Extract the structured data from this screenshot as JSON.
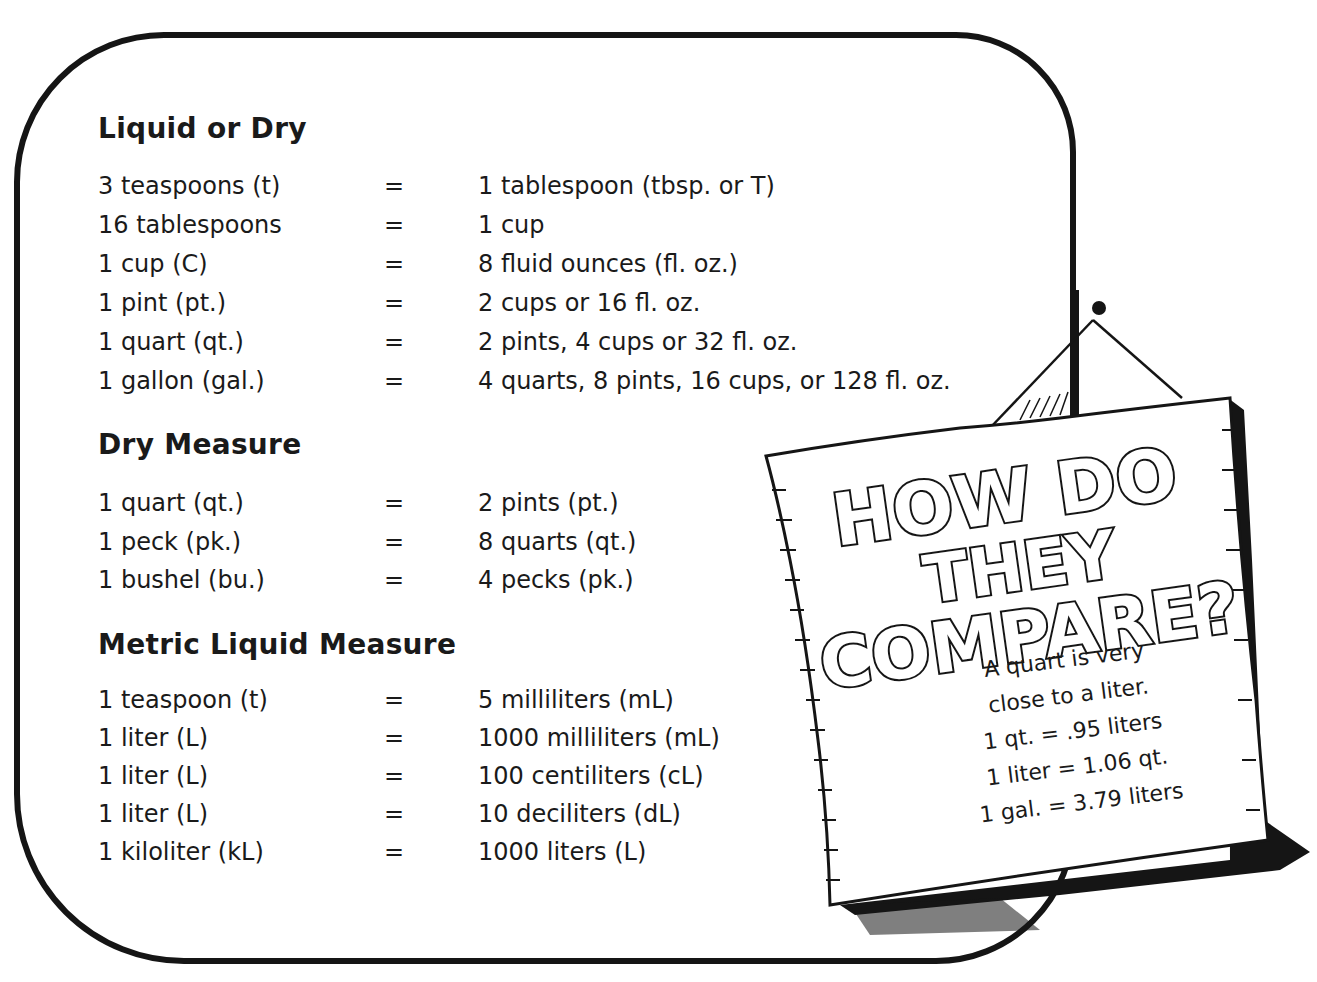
{
  "sections": [
    {
      "title": "Liquid or Dry",
      "rows": [
        {
          "lhs": "3 teaspoons (t)",
          "eq": "=",
          "rhs": "1 tablespoon (tbsp. or T)"
        },
        {
          "lhs": "16 tablespoons",
          "eq": "=",
          "rhs": "1 cup"
        },
        {
          "lhs": "1 cup (C)",
          "eq": "=",
          "rhs": "8 fluid ounces (fl. oz.)"
        },
        {
          "lhs": "1 pint (pt.)",
          "eq": "=",
          "rhs": "2 cups or 16 fl. oz."
        },
        {
          "lhs": "1 quart (qt.)",
          "eq": "=",
          "rhs": "2 pints, 4 cups or 32 fl. oz."
        },
        {
          "lhs": "1 gallon (gal.)",
          "eq": "=",
          "rhs": "4 quarts, 8 pints, 16 cups, or 128 fl. oz."
        }
      ]
    },
    {
      "title": "Dry Measure",
      "rows": [
        {
          "lhs": "1 quart (qt.)",
          "eq": "=",
          "rhs": "2 pints (pt.)"
        },
        {
          "lhs": "1 peck (pk.)",
          "eq": "=",
          "rhs": "8 quarts (qt.)"
        },
        {
          "lhs": "1 bushel (bu.)",
          "eq": "=",
          "rhs": "4 pecks (pk.)"
        }
      ]
    },
    {
      "title": "Metric Liquid Measure",
      "rows": [
        {
          "lhs": "1 teaspoon (t)",
          "eq": "=",
          "rhs": "5 milliliters (mL)"
        },
        {
          "lhs": "1 liter (L)",
          "eq": "=",
          "rhs": "1000 milliliters (mL)"
        },
        {
          "lhs": "1 liter (L)",
          "eq": "=",
          "rhs": "100 centiliters (cL)"
        },
        {
          "lhs": "1 liter (L)",
          "eq": "=",
          "rhs": "10 deciliters (dL)"
        },
        {
          "lhs": "1 kiloliter (kL)",
          "eq": "=",
          "rhs": "1000 liters (L)"
        }
      ]
    }
  ],
  "sign": {
    "headline": [
      "HOW DO",
      "THEY",
      "COMPARE?"
    ],
    "body": [
      "A quart is very",
      "close to a liter.",
      "1 qt. = .95 liters",
      "1 liter = 1.06 qt.",
      "1 gal. = 3.79 liters"
    ]
  },
  "colors": {
    "ink": "#151515",
    "paper": "#ffffff"
  }
}
